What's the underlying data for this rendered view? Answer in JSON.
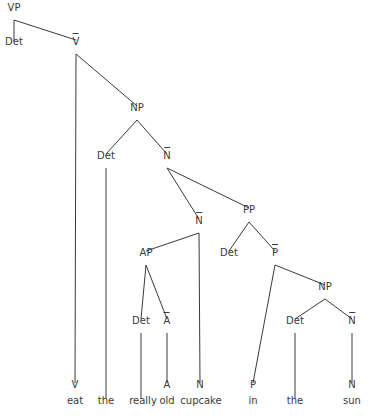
{
  "diagram": {
    "type": "syntax-tree",
    "line_color": "#3a3a3a",
    "nodes": [
      {
        "id": "vp",
        "label": "VP",
        "bar": false,
        "x": 14,
        "y": 8
      },
      {
        "id": "det0",
        "label": "Det",
        "bar": false,
        "x": 14,
        "y": 42
      },
      {
        "id": "vbar",
        "label": "V",
        "bar": true,
        "x": 76,
        "y": 42
      },
      {
        "id": "np1",
        "label": "NP",
        "bar": false,
        "x": 137,
        "y": 108
      },
      {
        "id": "det1",
        "label": "Det",
        "bar": false,
        "x": 106,
        "y": 156
      },
      {
        "id": "nbar1",
        "label": "N",
        "bar": true,
        "x": 167,
        "y": 156
      },
      {
        "id": "pp",
        "label": "PP",
        "bar": false,
        "x": 249,
        "y": 210
      },
      {
        "id": "nbar2",
        "label": "N",
        "bar": true,
        "x": 199,
        "y": 221
      },
      {
        "id": "ap",
        "label": "AP",
        "bar": false,
        "x": 146,
        "y": 253
      },
      {
        "id": "det3",
        "label": "Det",
        "bar": false,
        "x": 229,
        "y": 253
      },
      {
        "id": "pbar",
        "label": "P",
        "bar": true,
        "x": 275,
        "y": 253
      },
      {
        "id": "np2",
        "label": "NP",
        "bar": false,
        "x": 325,
        "y": 287
      },
      {
        "id": "det2",
        "label": "Det",
        "bar": false,
        "x": 141,
        "y": 321
      },
      {
        "id": "abar",
        "label": "A",
        "bar": true,
        "x": 167,
        "y": 321
      },
      {
        "id": "det4",
        "label": "Det",
        "bar": false,
        "x": 295,
        "y": 321
      },
      {
        "id": "nbar3",
        "label": "N",
        "bar": true,
        "x": 352,
        "y": 321
      },
      {
        "id": "v",
        "label": "V",
        "bar": false,
        "x": 75,
        "y": 385
      },
      {
        "id": "a",
        "label": "A",
        "bar": false,
        "x": 167,
        "y": 385
      },
      {
        "id": "n1",
        "label": "N",
        "bar": false,
        "x": 200,
        "y": 385
      },
      {
        "id": "p",
        "label": "P",
        "bar": false,
        "x": 253,
        "y": 385
      },
      {
        "id": "n2",
        "label": "N",
        "bar": false,
        "x": 352,
        "y": 385
      },
      {
        "id": "w_eat",
        "label": "eat",
        "bar": false,
        "x": 75,
        "y": 401
      },
      {
        "id": "w_the1",
        "label": "the",
        "bar": false,
        "x": 106,
        "y": 401
      },
      {
        "id": "w_really",
        "label": "really",
        "bar": false,
        "x": 143,
        "y": 401
      },
      {
        "id": "w_old",
        "label": "old",
        "bar": false,
        "x": 167,
        "y": 401
      },
      {
        "id": "w_cupcake",
        "label": "cupcake",
        "bar": false,
        "x": 201,
        "y": 401
      },
      {
        "id": "w_in",
        "label": "in",
        "bar": false,
        "x": 253,
        "y": 401
      },
      {
        "id": "w_the2",
        "label": "the",
        "bar": false,
        "x": 295,
        "y": 401
      },
      {
        "id": "w_sun",
        "label": "sun",
        "bar": false,
        "x": 352,
        "y": 401
      }
    ],
    "edges": [
      [
        14,
        20,
        14,
        41
      ],
      [
        14,
        20,
        76,
        40
      ],
      [
        76,
        54,
        75,
        383
      ],
      [
        76,
        54,
        137,
        106
      ],
      [
        137,
        120,
        106,
        154
      ],
      [
        137,
        120,
        167,
        154
      ],
      [
        106,
        168,
        106,
        399
      ],
      [
        167,
        168,
        249,
        208
      ],
      [
        167,
        168,
        199,
        219
      ],
      [
        199,
        233,
        146,
        251
      ],
      [
        199,
        233,
        200,
        383
      ],
      [
        146,
        265,
        141,
        319
      ],
      [
        146,
        265,
        167,
        319
      ],
      [
        141,
        333,
        141,
        399
      ],
      [
        167,
        333,
        167,
        383
      ],
      [
        249,
        222,
        229,
        251
      ],
      [
        249,
        222,
        275,
        251
      ],
      [
        275,
        265,
        253,
        383
      ],
      [
        275,
        265,
        325,
        285
      ],
      [
        325,
        299,
        295,
        319
      ],
      [
        325,
        299,
        352,
        319
      ],
      [
        295,
        333,
        295,
        399
      ],
      [
        352,
        333,
        352,
        383
      ]
    ]
  }
}
